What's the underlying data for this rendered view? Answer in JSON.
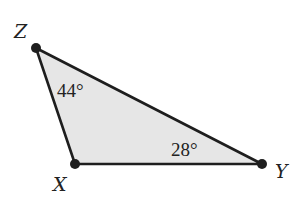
{
  "diagram": {
    "type": "triangle",
    "fill": "#e6e6e6",
    "stroke": "#1e1e1e",
    "vertices": {
      "Z": {
        "label": "Z",
        "x": 36,
        "y": 48
      },
      "X": {
        "label": "X",
        "x": 75,
        "y": 164
      },
      "Y": {
        "label": "Y",
        "x": 262,
        "y": 164
      }
    },
    "angles": {
      "Z": "44°",
      "Y": "28°"
    }
  }
}
